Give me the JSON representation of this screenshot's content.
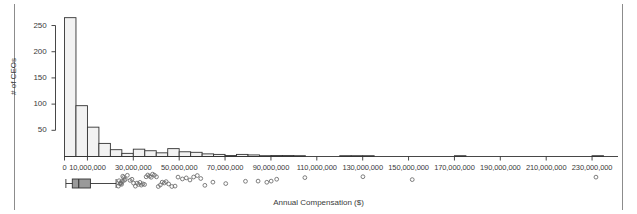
{
  "figure": {
    "width": 637,
    "height": 214,
    "background": "#ffffff",
    "border_color": "#8c8c8c"
  },
  "labels": {
    "ylabel": "# of CEOs",
    "xlabel": "Annual Compensation ($)",
    "ytick_labels": [
      "50",
      "100",
      "150",
      "200",
      "250"
    ],
    "xtick_labels": [
      "0",
      "10,000,000",
      "30,000,000",
      "50,000,000",
      "70,000,000",
      "90,000,000",
      "110,000,000",
      "130,000,000",
      "150,000,000",
      "170,000,000",
      "190,000,000",
      "210,000,000",
      "230,000,000"
    ]
  },
  "chart_data": {
    "type": "bar",
    "title": "",
    "subtitle": "",
    "xlabel": "Annual Compensation ($)",
    "ylabel": "# of CEOs",
    "xlim": [
      0,
      240000000
    ],
    "ylim": [
      0,
      272
    ],
    "grid": false,
    "legend": null,
    "bin_width": 5000000,
    "bar_fill": "#f2f2f2",
    "bar_stroke": "#333333",
    "ytick_values": [
      50,
      100,
      150,
      200,
      250
    ],
    "xtick_values": [
      0,
      10000000,
      30000000,
      50000000,
      70000000,
      90000000,
      110000000,
      130000000,
      150000000,
      170000000,
      190000000,
      210000000,
      230000000
    ],
    "categories": [
      "0-5M",
      "5-10M",
      "10-15M",
      "15-20M",
      "20-25M",
      "25-30M",
      "30-35M",
      "35-40M",
      "40-45M",
      "45-50M",
      "50-55M",
      "55-60M",
      "60-65M",
      "65-70M",
      "70-75M",
      "75-80M",
      "80-85M",
      "85-90M",
      "90-95M",
      "95-100M",
      "100-105M",
      "105-110M",
      "110-115M",
      "115-120M",
      "120-125M",
      "125-130M",
      "130-135M",
      "135-140M",
      "140-145M",
      "145-150M",
      "150-155M",
      "155-160M",
      "160-165M",
      "165-170M",
      "170-175M",
      "175-180M",
      "180-185M",
      "185-190M",
      "190-195M",
      "195-200M",
      "200-205M",
      "205-210M",
      "210-215M",
      "215-220M",
      "220-225M",
      "225-230M",
      "230-235M",
      "235-240M"
    ],
    "values": [
      265,
      97,
      56,
      25,
      13,
      6,
      14,
      11,
      7,
      15,
      9,
      8,
      5,
      4,
      2,
      4,
      3,
      1,
      2,
      2,
      1,
      0,
      0,
      0,
      1,
      1,
      1,
      0,
      0,
      0,
      0,
      0,
      0,
      0,
      1,
      0,
      0,
      0,
      0,
      0,
      0,
      0,
      0,
      0,
      0,
      0,
      1,
      0
    ]
  },
  "boxplot": {
    "type": "boxplot",
    "orientation": "horizontal",
    "whisker_low": 600000,
    "q1": 3400000,
    "median": 6200000,
    "q3": 11300000,
    "whisker_high": 22500000,
    "box_fill": "#9a9a9a",
    "box_stroke": "#333333",
    "outlier_color": "#6f6f6f",
    "outliers": [
      23500000,
      23800000,
      24200000,
      24400000,
      24600000,
      24900000,
      25200000,
      25400000,
      25800000,
      26100000,
      26500000,
      27400000,
      28600000,
      29400000,
      30100000,
      30900000,
      31600000,
      32300000,
      32900000,
      33500000,
      34200000,
      34900000,
      35600000,
      36300000,
      37100000,
      37800000,
      38400000,
      39200000,
      40100000,
      40900000,
      41800000,
      42600000,
      43500000,
      44300000,
      45400000,
      46800000,
      48200000,
      49500000,
      51400000,
      53100000,
      54700000,
      56300000,
      57900000,
      59400000,
      61200000,
      64700000,
      70300000,
      78900000,
      84400000,
      88200000,
      90100000,
      92500000,
      104800000,
      130100000,
      151600000,
      231700000
    ]
  }
}
